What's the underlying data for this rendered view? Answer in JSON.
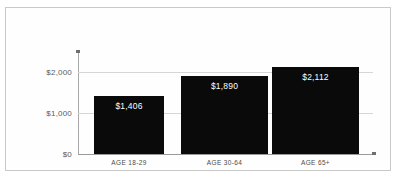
{
  "chart_data": {
    "type": "bar",
    "title": "",
    "xlabel": "",
    "ylabel": "",
    "categories": [
      "AGE 18-29",
      "AGE 30-64",
      "AGE 65+"
    ],
    "values": [
      1406,
      1890,
      2112
    ],
    "value_labels": [
      "$1,406",
      "$1,890",
      "$2,112"
    ],
    "ylim": [
      0,
      2500
    ],
    "yticks": [
      0,
      1000,
      2000
    ],
    "ytick_labels": [
      "$0",
      "$1,000",
      "$2,000"
    ],
    "grid": true,
    "gridlines_at": [
      1000,
      2000
    ],
    "legend": "none",
    "bar_color": "#0a0a0a",
    "value_label_color": "#ffffff",
    "gridline_color": "#d6d6d6",
    "axis_color": "#9a9a9a",
    "tick_text_color": "#5a5a5a",
    "frame_color": "#c9c9c9",
    "background_color": "#fefefe"
  }
}
